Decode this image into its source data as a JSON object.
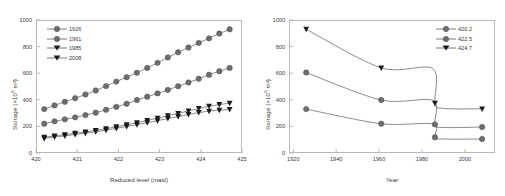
{
  "figure": {
    "background": "#ffffff",
    "axis_color": "#b9b9b9",
    "text_color": "#3a3a3a",
    "series_colors": {
      "circle_marker": "#6e6e6e",
      "triangle_marker": "#1a1a1a",
      "line": "#5a5a5a"
    }
  },
  "chart_data": [
    {
      "type": "line",
      "title": "",
      "xlabel": "Reduced level (masl)",
      "ylabel": "Storage (×10⁶ m³)",
      "ylabel_prefix": "Storage (×10",
      "ylabel_sup": "6",
      "ylabel_suffix": " m³)",
      "xlim": [
        420,
        425
      ],
      "ylim": [
        0,
        1000
      ],
      "xticks": [
        420,
        421,
        422,
        423,
        424,
        425
      ],
      "yticks": [
        0,
        200,
        400,
        600,
        800,
        1000
      ],
      "grid": false,
      "legend_position": "top-left",
      "x": [
        420.2,
        420.45,
        420.7,
        420.95,
        421.2,
        421.45,
        421.7,
        421.95,
        422.2,
        422.45,
        422.7,
        422.95,
        423.2,
        423.45,
        423.7,
        423.95,
        424.2,
        424.45,
        424.7
      ],
      "series": [
        {
          "name": "1926",
          "marker": "circle",
          "values": [
            330,
            358,
            385,
            412,
            440,
            470,
            503,
            537,
            570,
            603,
            640,
            678,
            718,
            757,
            793,
            828,
            862,
            898,
            930
          ]
        },
        {
          "name": "1961",
          "marker": "circle",
          "values": [
            220,
            238,
            253,
            268,
            285,
            303,
            325,
            347,
            370,
            398,
            423,
            448,
            475,
            502,
            530,
            558,
            588,
            615,
            640
          ]
        },
        {
          "name": "1985",
          "marker": "triangle",
          "values": [
            118,
            128,
            138,
            148,
            158,
            170,
            183,
            197,
            212,
            228,
            245,
            262,
            280,
            298,
            316,
            334,
            352,
            364,
            375
          ]
        },
        {
          "name": "2008",
          "marker": "triangle",
          "values": [
            110,
            120,
            129,
            139,
            149,
            160,
            172,
            185,
            199,
            213,
            228,
            243,
            259,
            274,
            290,
            304,
            315,
            322,
            327
          ]
        }
      ]
    },
    {
      "type": "line",
      "title": "",
      "xlabel": "Year",
      "ylabel": "Storage (×10⁶ m³)",
      "ylabel_prefix": "Storage (×10",
      "ylabel_sup": "6",
      "ylabel_suffix": " m³)",
      "xlim": [
        1918,
        2014
      ],
      "ylim": [
        0,
        1000
      ],
      "xticks": [
        1920,
        1940,
        1960,
        1980,
        2000
      ],
      "yticks": [
        0,
        200,
        400,
        600,
        800,
        1000
      ],
      "grid": false,
      "legend_position": "top-right",
      "x": [
        1926,
        1961,
        1985,
        1986,
        1990,
        2008
      ],
      "series": [
        {
          "name": "420.2",
          "marker": "circle",
          "values": [
            330,
            220,
            218,
            118,
            105,
            105
          ]
        },
        {
          "name": "422.5",
          "marker": "circle",
          "values": [
            605,
            398,
            395,
            215,
            192,
            195
          ]
        },
        {
          "name": "424.7",
          "marker": "triangle",
          "values": [
            930,
            640,
            635,
            375,
            335,
            332
          ]
        }
      ]
    }
  ]
}
